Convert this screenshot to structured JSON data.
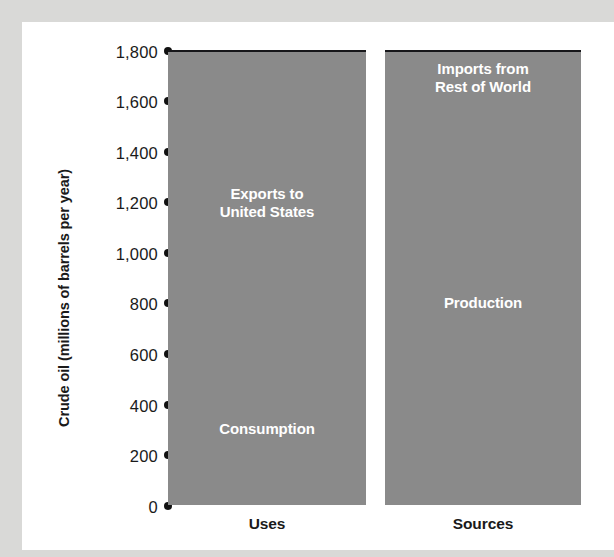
{
  "chart_data": {
    "type": "bar",
    "subtype": "stacked-bar",
    "title": "",
    "xlabel": "",
    "ylabel": "Crude oil (millions of barrels per year)",
    "ylim": [
      0,
      1800
    ],
    "ytick_values": [
      1800,
      1600,
      1400,
      1200,
      1000,
      800,
      600,
      400,
      200,
      0
    ],
    "ytick_labels": [
      "1,800",
      "1,600",
      "1,400",
      "1,200",
      "1,000",
      "800",
      "600",
      "400",
      "200",
      "0"
    ],
    "ytick_marker": "filled-circle",
    "grid": false,
    "legend": false,
    "categories": [
      "Uses",
      "Sources"
    ],
    "bars": [
      {
        "category": "Uses",
        "total": 1800,
        "segments": [
          {
            "name": "Consumption",
            "label": "Consumption",
            "start": 0,
            "end": 600,
            "value": 600
          },
          {
            "name": "Exports to United States",
            "label": "Exports to\nUnited States",
            "start": 600,
            "end": 1800,
            "value": 1200
          }
        ]
      },
      {
        "category": "Sources",
        "total": 1800,
        "segments": [
          {
            "name": "Production",
            "label": "Production",
            "start": 0,
            "end": 1600,
            "value": 1600
          },
          {
            "name": "Imports from Rest of World",
            "label": "Imports from\nRest of World",
            "start": 1600,
            "end": 1800,
            "value": 200
          }
        ]
      }
    ],
    "colors": {
      "bar_fill": "#8a8a8a",
      "segment_divider": "#17171a",
      "segment_label_text": "#ffffff",
      "axis_text": "#1a1a1a",
      "plot_background": "#ffffff",
      "page_background": "#d9d9d7"
    }
  },
  "axis": {
    "y_title": "Crude oil (millions of barrels per year)",
    "ticks": [
      {
        "label": "1,800",
        "value": 1800
      },
      {
        "label": "1,600",
        "value": 1600
      },
      {
        "label": "1,400",
        "value": 1400
      },
      {
        "label": "1,200",
        "value": 1200
      },
      {
        "label": "1,000",
        "value": 1000
      },
      {
        "label": "800",
        "value": 800
      },
      {
        "label": "600",
        "value": 600
      },
      {
        "label": "400",
        "value": 400
      },
      {
        "label": "200",
        "value": 200
      },
      {
        "label": "0",
        "value": 0
      }
    ]
  },
  "bars": {
    "uses": {
      "category_label": "Uses",
      "upper_segment_label": "Exports to\nUnited States",
      "lower_segment_label": "Consumption"
    },
    "sources": {
      "category_label": "Sources",
      "upper_segment_label": "Imports from\nRest of World",
      "lower_segment_label": "Production"
    }
  }
}
